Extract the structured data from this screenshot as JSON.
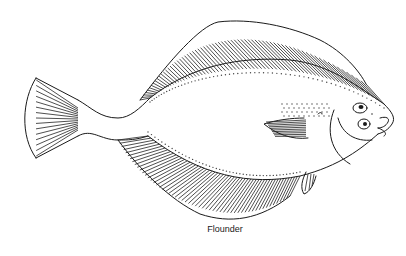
{
  "illustration": {
    "subject": "flounder",
    "style": "black line drawing on white",
    "colors": {
      "background": "#ffffff",
      "line": "#1a1a1a"
    },
    "parts": [
      "caudal-fin",
      "caudal-peduncle",
      "dorsal-fin",
      "anal-fin",
      "body",
      "pectoral-fin",
      "pelvic-fin",
      "head",
      "eyes",
      "mouth",
      "lateral-dots"
    ]
  },
  "caption": "Flounder"
}
